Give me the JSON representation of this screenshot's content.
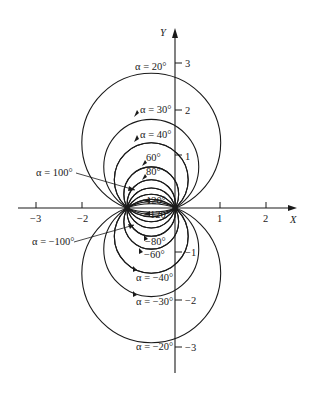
{
  "figure": {
    "axes": {
      "x_label": "X",
      "y_label": "Y",
      "x_ticks": [
        {
          "value": -3,
          "label": "−3"
        },
        {
          "value": -2,
          "label": "−2"
        },
        {
          "value": 1,
          "label": "1"
        },
        {
          "value": 2,
          "label": "2"
        }
      ],
      "y_ticks": [
        {
          "value": 3,
          "label": "3"
        },
        {
          "value": 2,
          "label": "2"
        },
        {
          "value": 1,
          "label": "1"
        },
        {
          "value": -1,
          "label": "−1"
        },
        {
          "value": -2,
          "label": "−2"
        },
        {
          "value": -3,
          "label": "−3"
        }
      ]
    },
    "foci": [
      {
        "x": -1,
        "y": 0
      },
      {
        "x": 0,
        "y": 0
      }
    ],
    "circles_alpha_deg": [
      20,
      30,
      40,
      60,
      80,
      100,
      120,
      140
    ],
    "labels": {
      "a20": "α = 20°",
      "a30": "α = 30°",
      "a40": "α = 40°",
      "a60": "60°",
      "a80": "80°",
      "a100": "α = 100°",
      "a120": "120°",
      "am120": "−120°",
      "am100": "α = −100°",
      "am80": "−80°",
      "am60": "−60°",
      "am40": "α = −40°",
      "am30": "α = −30°",
      "am20": "α = −20°"
    }
  }
}
